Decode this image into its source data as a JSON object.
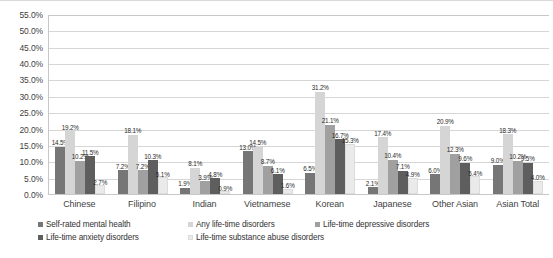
{
  "chart_data": {
    "type": "bar",
    "title": "",
    "subtitle": "",
    "xlabel": "",
    "ylabel": "",
    "ylim": [
      0,
      55
    ],
    "ytick_step": 5,
    "grid": true,
    "legend_position": "bottom",
    "value_labels": true,
    "categories": [
      "Chinese",
      "Filipino",
      "Indian",
      "Vietnamese",
      "Korean",
      "Japanese",
      "Other Asian",
      "Asian Total"
    ],
    "yticks": [
      "0.0%",
      "5.0%",
      "10.0%",
      "15.0%",
      "20.0%",
      "25.0%",
      "30.0%",
      "35.0%",
      "40.0%",
      "45.0%",
      "50.0%",
      "55.0%"
    ],
    "series": [
      {
        "name": "Self-rated mental health",
        "color": "#767676",
        "values": [
          14.5,
          7.2,
          1.9,
          13.0,
          6.5,
          2.1,
          6.0,
          9.0
        ],
        "labels": [
          "14.5%",
          "7.2%",
          "1.9%",
          "13.0%",
          "6.5%",
          "2.1%",
          "6.0%",
          "9.0%"
        ]
      },
      {
        "name": "Any life-time disorders",
        "color": "#d5d5d5",
        "values": [
          19.2,
          18.1,
          8.1,
          14.5,
          31.2,
          17.4,
          20.9,
          18.3
        ],
        "labels": [
          "19.2%",
          "18.1%",
          "8.1%",
          "14.5%",
          "31.2%",
          "17.4%",
          "20.9%",
          "18.3%"
        ]
      },
      {
        "name": "Life-time depressive disorders",
        "color": "#a0a0a0",
        "values": [
          10.2,
          7.2,
          3.9,
          8.7,
          21.1,
          10.4,
          12.3,
          10.2
        ],
        "labels": [
          "10.2%",
          "7.2%",
          "3.9%",
          "8.7%",
          "21.1%",
          "10.4%",
          "12.3%",
          "10.2%"
        ]
      },
      {
        "name": "Life-time anxiety disorders",
        "color": "#5e5e5e",
        "values": [
          11.5,
          10.3,
          4.8,
          6.1,
          16.7,
          7.1,
          9.6,
          9.5
        ],
        "labels": [
          "11.5%",
          "10.3%",
          "4.8%",
          "6.1%",
          "16.7%",
          "7.1%",
          "9.6%",
          "9.5%"
        ]
      },
      {
        "name": "Life-time substance abuse disorders",
        "color": "#eaeaea",
        "values": [
          2.7,
          5.1,
          0.9,
          1.6,
          15.3,
          4.9,
          5.4,
          4.0
        ],
        "labels": [
          "2.7%",
          "5.1%",
          "0.9%",
          "1.6%",
          "15.3%",
          "4.9%",
          "5.4%",
          "4.0%"
        ]
      }
    ]
  }
}
